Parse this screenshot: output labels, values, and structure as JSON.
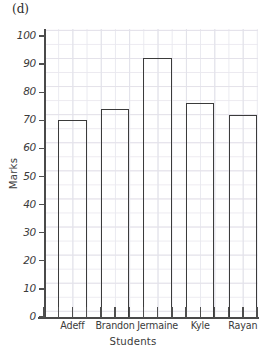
{
  "panel": {
    "label": "(d)"
  },
  "chart_data": {
    "type": "bar",
    "title": "",
    "subtitle": "",
    "xlabel": "Students",
    "ylabel": "Marks",
    "categories": [
      "Adeff",
      "Brandon",
      "Jermaine",
      "Kyle",
      "Rayan"
    ],
    "values": [
      70,
      74,
      92,
      76,
      72
    ],
    "series": [
      {
        "name": "Marks",
        "values": [
          70,
          74,
          92,
          76,
          72
        ]
      }
    ],
    "ylim": [
      0,
      100
    ],
    "y_ticks": [
      0,
      10,
      20,
      30,
      40,
      50,
      60,
      70,
      80,
      90,
      100
    ],
    "y_tick_labels": [
      "0",
      "10",
      "20",
      "30",
      "40",
      "50",
      "60",
      "70",
      "80",
      "90",
      "100"
    ],
    "grid": true,
    "grid_style": "graph-paper minor and major gridlines",
    "legend": "none",
    "bar_style": "outlined, unfilled",
    "bar_edge_color": "#3b3b3b",
    "bar_fill_color": "#ffffff",
    "axis_color": "#4a4a4a",
    "grid_color_minor": "#e9e9ef",
    "grid_color_major": "#e2e2ea",
    "background_color": "#ffffff",
    "annotations": [
      "(d)"
    ]
  }
}
